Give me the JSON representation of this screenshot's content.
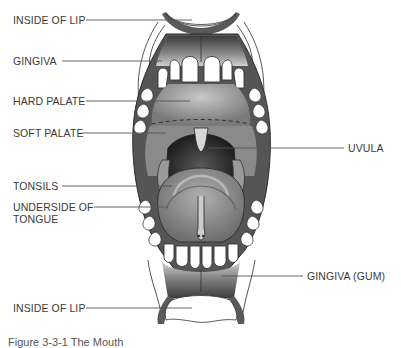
{
  "figure": {
    "caption": "Figure 3-3-1 The Mouth"
  },
  "labels": {
    "inside_of_lip_top": "INSIDE OF LIP",
    "gingiva": "GINGIVA",
    "hard_palate": "HARD PALATE",
    "soft_palate": "SOFT PALATE",
    "uvula": "UVULA",
    "tonsils": "TONSILS",
    "underside_of_tongue_line1": "UNDERSIDE OF",
    "underside_of_tongue_line2": "TONGUE",
    "gingiva_gum": "GINGIVA (GUM)",
    "inside_of_lip_bottom": "INSIDE OF LIP"
  },
  "colors": {
    "outline": "#2b2b2b",
    "gum_dark": "#4a4a4a",
    "gum_light": "#bdbdbd",
    "palate": "#9a9a9a",
    "throat": "#3a3a3a",
    "tongue": "#8c8c8c",
    "teeth": "#ffffff",
    "leader_line": "#555555",
    "text": "#3a3a3a"
  }
}
